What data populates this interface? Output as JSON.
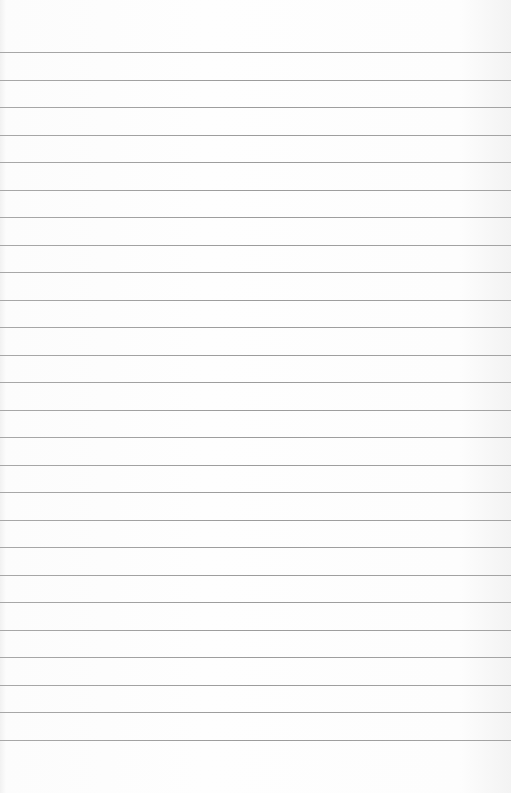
{
  "page": {
    "type": "lined-paper",
    "background_color": "#fdfdfd",
    "line_color": "#9e9e9e",
    "line_count": 26,
    "first_line_y": 52,
    "line_spacing": 27.5
  }
}
